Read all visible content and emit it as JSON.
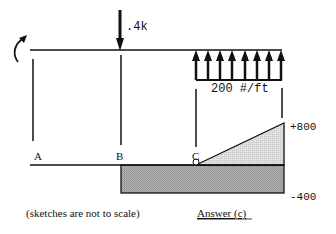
{
  "diagram": {
    "type": "shear-and-moment-sketch",
    "loads": {
      "moment_symbol": "curved-arrow-counterclockwise",
      "point_load": {
        "label": ".4k",
        "direction": "down",
        "location": "B"
      },
      "distributed_load": {
        "label": "200 #/ft",
        "direction": "up",
        "arrow_count": 8,
        "from": "C",
        "to": "end"
      }
    },
    "points": {
      "a": "A",
      "b": "B",
      "c": "C"
    },
    "values": {
      "top": "+800",
      "bottom": "-400"
    },
    "caption": "(sketches are not to scale)",
    "answer_label": "Answer (c)",
    "colors": {
      "line": "#111111",
      "shade_dark": "#a8a8a8",
      "shade_light": "#d8d8d8",
      "background": "#ffffff"
    }
  }
}
